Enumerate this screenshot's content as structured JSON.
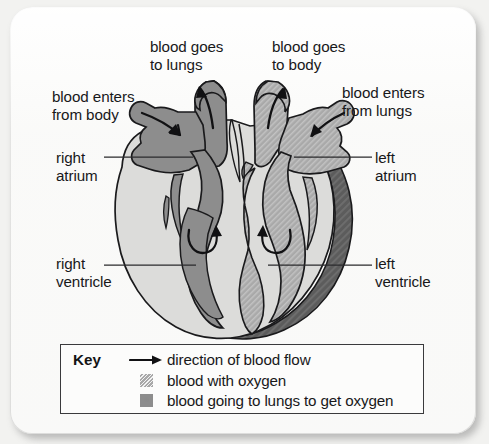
{
  "diagram": {
    "labels": {
      "blood_goes_to_lungs": "blood goes\nto lungs",
      "blood_goes_to_body": "blood goes\nto body",
      "blood_enters_from_body": "blood enters\nfrom body",
      "blood_enters_from_lungs": "blood enters\nfrom lungs",
      "right_atrium": "right\natrium",
      "left_atrium": "left\natrium",
      "right_ventricle": "right\nventricle",
      "left_ventricle": "left\nventricle"
    },
    "colors": {
      "background": "#f2f2f0",
      "card": "#fbfbfa",
      "deoxygenated_blood": "#8d8d8d",
      "oxygenated_blood": "#a8a8a8",
      "heart_muscle_wall": "#5a5a5a",
      "chamber_cavity": "#d9d9d7",
      "outline": "#1a1a1c",
      "text": "#18181a"
    },
    "flow_arrows": [
      {
        "name": "into-right-atrium",
        "direction": "right-down"
      },
      {
        "name": "out-to-lungs",
        "direction": "up-left"
      },
      {
        "name": "out-to-body",
        "direction": "up-right"
      },
      {
        "name": "into-left-atrium",
        "direction": "left-down"
      },
      {
        "name": "right-atrium-to-right-ventricle",
        "direction": "curved-clockwise"
      },
      {
        "name": "left-atrium-to-left-ventricle",
        "direction": "curved-counterclockwise"
      }
    ]
  },
  "key": {
    "title": "Key",
    "rows": [
      {
        "marker": "arrow-right-icon",
        "label": "direction of blood flow"
      },
      {
        "marker": "swatch-oxygenated",
        "label": "blood with oxygen"
      },
      {
        "marker": "swatch-deoxygenated",
        "label": "blood going to lungs to get oxygen"
      }
    ]
  }
}
